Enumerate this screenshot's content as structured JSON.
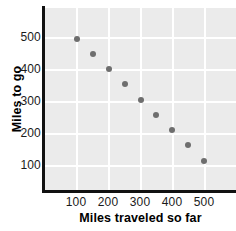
{
  "chart_data": {
    "type": "scatter",
    "title": "",
    "xlabel": "Miles traveled so far",
    "ylabel": "Miles to go",
    "xlim": [
      0,
      600
    ],
    "ylim": [
      0,
      600
    ],
    "xticks": [
      100,
      200,
      300,
      400,
      500
    ],
    "yticks": [
      100,
      200,
      300,
      400,
      500
    ],
    "xtick_labels": [
      "100",
      "200",
      "300",
      "400",
      "500"
    ],
    "ytick_labels": [
      "100",
      "200",
      "300",
      "400",
      "500"
    ],
    "grid": true,
    "legend": "none",
    "series": [
      {
        "name": "Miles to go vs miles traveled",
        "color": "#6e6e6e",
        "marker": "circle",
        "points": [
          {
            "x": 100,
            "y": 500
          },
          {
            "x": 150,
            "y": 450
          },
          {
            "x": 200,
            "y": 400
          },
          {
            "x": 250,
            "y": 350
          },
          {
            "x": 300,
            "y": 300
          },
          {
            "x": 350,
            "y": 250
          },
          {
            "x": 400,
            "y": 200
          },
          {
            "x": 450,
            "y": 150
          },
          {
            "x": 500,
            "y": 100
          }
        ]
      }
    ]
  },
  "colors": {
    "plot_background": "#ebebeb",
    "gridline": "#ffffff",
    "axis": "#111111",
    "marker": "#6e6e6e",
    "text": "#1a1a1a"
  }
}
